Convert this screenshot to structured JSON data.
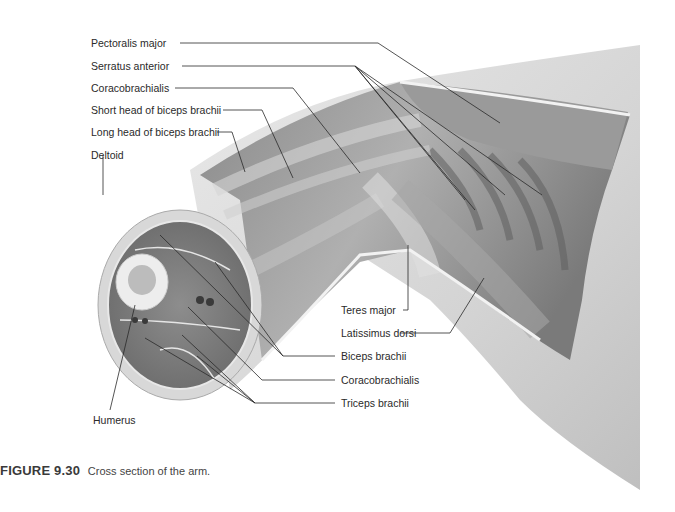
{
  "figure": {
    "number": "FIGURE 9.30",
    "caption": "Cross section of the arm."
  },
  "labels_left": [
    {
      "text": "Pectoralis major",
      "x": 91,
      "y": 38
    },
    {
      "text": "Serratus anterior",
      "x": 91,
      "y": 61
    },
    {
      "text": "Coracobrachialis",
      "x": 91,
      "y": 83
    },
    {
      "text": "Short head of biceps brachii",
      "x": 91,
      "y": 105
    },
    {
      "text": "Long head of biceps brachii",
      "x": 91,
      "y": 127
    },
    {
      "text": "Deltoid",
      "x": 91,
      "y": 150
    }
  ],
  "labels_right": [
    {
      "text": "Teres major",
      "x": 341,
      "y": 305
    },
    {
      "text": "Latissimus dorsi",
      "x": 341,
      "y": 328
    },
    {
      "text": "Biceps brachii",
      "x": 341,
      "y": 351
    },
    {
      "text": "Coracobrachialis",
      "x": 341,
      "y": 375
    },
    {
      "text": "Triceps brachii",
      "x": 341,
      "y": 398
    }
  ],
  "labels_bottom": [
    {
      "text": "Humerus",
      "x": 93,
      "y": 415
    }
  ],
  "colors": {
    "background": "#ffffff",
    "skin": "#d9d9d9",
    "muscle_dark": "#6e6e6e",
    "muscle_light": "#bdbdbd",
    "leader_line": "#2a2a2a"
  }
}
